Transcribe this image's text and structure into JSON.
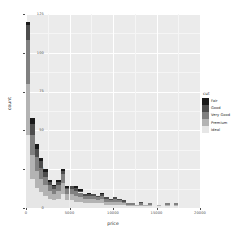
{
  "chart_data": {
    "type": "bar",
    "subtype": "stacked-histogram",
    "title": "",
    "xlabel": "price",
    "ylabel": "count",
    "xlim": [
      0,
      20000
    ],
    "ylim": [
      0,
      125
    ],
    "xticks": [
      0,
      5000,
      10000,
      15000,
      20000
    ],
    "xticklabels": [
      "0",
      "5000",
      "10000",
      "15000",
      "20000"
    ],
    "yticks": [
      0,
      25,
      50,
      75,
      100,
      125
    ],
    "yticklabels": [
      "0",
      "25",
      "50",
      "75",
      "100",
      "125"
    ],
    "grid": true,
    "grid_color": "#FFFFFF",
    "panel_background": "#EBEBEB",
    "legend_title": "cut",
    "legend_position": "right",
    "bin_width": 500,
    "bin_starts": [
      0,
      500,
      1000,
      1500,
      2000,
      2500,
      3000,
      3500,
      4000,
      4500,
      5000,
      5500,
      6000,
      6500,
      7000,
      7500,
      8000,
      8500,
      9000,
      9500,
      10000,
      10500,
      11000,
      11500,
      12000,
      12500,
      13000,
      13500,
      14000,
      14500,
      15000,
      15500,
      16000,
      16500,
      17000,
      17500,
      18000,
      18500
    ],
    "series": [
      {
        "name": "Fair",
        "color": "#1A1A1A",
        "values": [
          2,
          4,
          3,
          2,
          2,
          1,
          1,
          1,
          1,
          1,
          0,
          1,
          1,
          0,
          1,
          0,
          0,
          1,
          0,
          0,
          0,
          0,
          0,
          0,
          0,
          0,
          0,
          0,
          0,
          0,
          0,
          0,
          0,
          0,
          0,
          0,
          0,
          0
        ]
      },
      {
        "name": "Good",
        "color": "#4D4D4D",
        "values": [
          10,
          7,
          5,
          4,
          3,
          2,
          2,
          2,
          2,
          1,
          2,
          2,
          1,
          1,
          1,
          1,
          1,
          1,
          1,
          1,
          1,
          1,
          1,
          0,
          0,
          0,
          1,
          0,
          0,
          0,
          0,
          0,
          0,
          0,
          0,
          0,
          0,
          0
        ]
      },
      {
        "name": "Very Good",
        "color": "#808080",
        "values": [
          28,
          13,
          9,
          7,
          5,
          4,
          3,
          4,
          6,
          3,
          3,
          3,
          3,
          2,
          2,
          2,
          2,
          2,
          2,
          1,
          2,
          1,
          1,
          1,
          1,
          0,
          1,
          0,
          1,
          0,
          0,
          0,
          1,
          0,
          1,
          0,
          0,
          0
        ]
      },
      {
        "name": "Premium",
        "color": "#B3B3B3",
        "values": [
          33,
          15,
          11,
          9,
          7,
          5,
          4,
          5,
          7,
          4,
          4,
          4,
          3,
          3,
          3,
          3,
          2,
          3,
          2,
          2,
          2,
          2,
          1,
          1,
          1,
          1,
          1,
          1,
          1,
          0,
          1,
          0,
          1,
          0,
          1,
          0,
          0,
          0
        ]
      },
      {
        "name": "Ideal",
        "color": "#E6E6E6",
        "values": [
          47,
          19,
          13,
          10,
          8,
          6,
          5,
          6,
          9,
          5,
          5,
          4,
          4,
          3,
          3,
          3,
          3,
          3,
          2,
          2,
          2,
          2,
          2,
          1,
          1,
          1,
          1,
          1,
          1,
          0,
          1,
          0,
          1,
          0,
          1,
          0,
          0,
          0
        ]
      }
    ],
    "legend_entries": [
      {
        "label": "Fair",
        "color": "#1A1A1A"
      },
      {
        "label": "Good",
        "color": "#4D4D4D"
      },
      {
        "label": "Very Good",
        "color": "#808080"
      },
      {
        "label": "Premium",
        "color": "#B3B3B3"
      },
      {
        "label": "Ideal",
        "color": "#E6E6E6"
      }
    ]
  }
}
